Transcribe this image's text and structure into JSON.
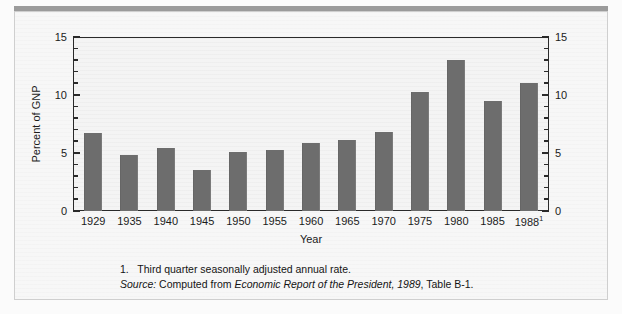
{
  "chart_data": {
    "type": "bar",
    "title": "",
    "xlabel": "Year",
    "ylabel": "Percent of GNP",
    "ylim": [
      0,
      15
    ],
    "ytick_values": [
      0,
      5,
      10,
      15
    ],
    "ytick_labels_left": [
      "0",
      "5",
      "10",
      "15"
    ],
    "ytick_labels_right": [
      "0",
      "5",
      "10",
      "15"
    ],
    "y_minor_tick_step": 1,
    "grid": false,
    "legend": "none",
    "dual_y_axis": true,
    "bar_color": "#6d6d6d",
    "categories": [
      "1929",
      "1935",
      "1940",
      "1945",
      "1950",
      "1955",
      "1960",
      "1965",
      "1970",
      "1975",
      "1980",
      "1985",
      "1988"
    ],
    "category_labels": [
      {
        "text": "1929",
        "superscript": ""
      },
      {
        "text": "1935",
        "superscript": ""
      },
      {
        "text": "1940",
        "superscript": ""
      },
      {
        "text": "1945",
        "superscript": ""
      },
      {
        "text": "1950",
        "superscript": ""
      },
      {
        "text": "1955",
        "superscript": ""
      },
      {
        "text": "1960",
        "superscript": ""
      },
      {
        "text": "1965",
        "superscript": ""
      },
      {
        "text": "1970",
        "superscript": ""
      },
      {
        "text": "1975",
        "superscript": ""
      },
      {
        "text": "1980",
        "superscript": ""
      },
      {
        "text": "1985",
        "superscript": ""
      },
      {
        "text": "1988",
        "superscript": "1"
      }
    ],
    "values": [
      6.7,
      4.8,
      5.4,
      3.5,
      5.1,
      5.3,
      5.9,
      6.1,
      6.8,
      10.3,
      13.0,
      9.5,
      11.0
    ]
  },
  "notes": {
    "footnote_marker": "1.",
    "footnote_text": "Third quarter seasonally adjusted annual rate.",
    "source_label": "Source:",
    "source_prefix": "Computed from",
    "source_italic": "Economic Report of the President, 1989",
    "source_suffix": ", Table B-1."
  }
}
